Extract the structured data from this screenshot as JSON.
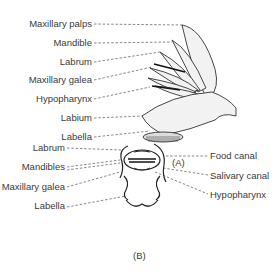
{
  "figure_a": {
    "caption": "(A)",
    "labels": [
      {
        "text": "Maxillary palps",
        "y": 18
      },
      {
        "text": "Mandible",
        "y": 37
      },
      {
        "text": "Labrum",
        "y": 56
      },
      {
        "text": "Maxillary galea",
        "y": 74
      },
      {
        "text": "Hypopharynx",
        "y": 93
      },
      {
        "text": "Labium",
        "y": 112
      },
      {
        "text": "Labella",
        "y": 131
      }
    ]
  },
  "figure_b": {
    "caption": "(B)",
    "left_labels": [
      {
        "text": "Labrum",
        "y": 143
      },
      {
        "text": "Mandibles",
        "y": 163
      },
      {
        "text": "Maxillary galea",
        "y": 184
      },
      {
        "text": "Labella",
        "y": 203
      }
    ],
    "right_labels": [
      {
        "text": "Food canal",
        "y": 152
      },
      {
        "text": "Salivary canal",
        "y": 170
      },
      {
        "text": "Hypopharynx",
        "y": 189
      }
    ]
  }
}
